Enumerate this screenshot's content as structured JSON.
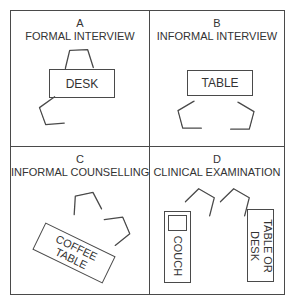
{
  "figure": {
    "panels": {
      "a": {
        "letter": "A",
        "title": "FORMAL INTERVIEW",
        "desk_label": "DESK"
      },
      "b": {
        "letter": "B",
        "title": "INFORMAL INTERVIEW",
        "table_label": "TABLE"
      },
      "c": {
        "letter": "C",
        "title": "INFORMAL COUNSELLING",
        "coffee_table_line1": "COFFEE",
        "coffee_table_line2": "TABLE"
      },
      "d": {
        "letter": "D",
        "title": "CLINICAL EXAMINATION",
        "couch_label": "COUCH",
        "table_desk_line1": "TABLE OR",
        "table_desk_line2": "DESK"
      }
    },
    "icons": {
      "chair": "chair-icon (open trapezoid, plan view of a chair)"
    },
    "colors": {
      "line": "#4a4a4a",
      "text": "#333333",
      "background": "#ffffff"
    }
  }
}
